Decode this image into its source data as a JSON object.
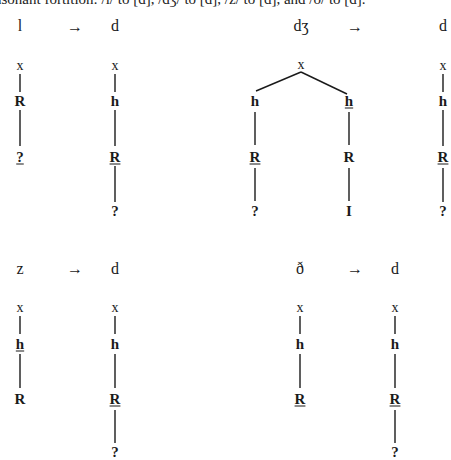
{
  "caption": "nsonant fortition: /l/ to [d], /dʒ/ to [d], /z/ to [d], and /ð/ to [d].",
  "arrow": "→",
  "top_left": {
    "source": "l",
    "target": "d",
    "source_tree": {
      "x": "x",
      "n1": "R",
      "n2": "?"
    },
    "target_tree": {
      "x": "x",
      "n1": "h",
      "n2": "R",
      "n3": "?"
    }
  },
  "top_right": {
    "source": "dʒ",
    "target": "d",
    "source_tree": {
      "x": "x",
      "left": {
        "n1": "h",
        "n2": "R",
        "n3": "?"
      },
      "right": {
        "n1": "h",
        "n2": "R",
        "n3": "I"
      }
    },
    "target_tree": {
      "x": "x",
      "n1": "h",
      "n2": "R",
      "n3": "?"
    }
  },
  "bottom_left": {
    "source": "z",
    "target": "d",
    "source_tree": {
      "x": "x",
      "n1": "h",
      "n2": "R"
    },
    "target_tree": {
      "x": "x",
      "n1": "h",
      "n2": "R",
      "n3": "?"
    }
  },
  "bottom_right": {
    "source": "ð",
    "target": "d",
    "source_tree": {
      "x": "x",
      "n1": "h",
      "n2": "R"
    },
    "target_tree": {
      "x": "x",
      "n1": "h",
      "n2": "R",
      "n3": "?"
    }
  }
}
